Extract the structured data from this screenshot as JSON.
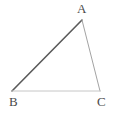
{
  "figure": {
    "type": "geometry-diagram",
    "shape": "triangle",
    "background_color": "#ffffff",
    "width": 116,
    "height": 114
  },
  "labels": {
    "a": "A",
    "b": "B",
    "c": "C"
  },
  "label_positions": {
    "a": {
      "x": 77,
      "y": 2
    },
    "b": {
      "x": 9,
      "y": 95
    },
    "c": {
      "x": 97,
      "y": 95
    }
  },
  "vertices": {
    "a": {
      "x": 82,
      "y": 20
    },
    "b": {
      "x": 12,
      "y": 91
    },
    "c": {
      "x": 100,
      "y": 91
    }
  },
  "sides": [
    {
      "name": "side-ab",
      "from": "B",
      "to": "A",
      "color": "#5a5a5a",
      "width": 1.6
    },
    {
      "name": "side-ac",
      "from": "A",
      "to": "C",
      "color": "#a3a3a3",
      "width": 1.0
    },
    {
      "name": "side-bc",
      "from": "B",
      "to": "C",
      "color": "#c6c6c6",
      "width": 1.0
    }
  ],
  "colors": {
    "label_text": "#4a4a4a",
    "stroke_dark": "#5a5a5a",
    "stroke_medium": "#a3a3a3",
    "stroke_light": "#c6c6c6",
    "background": "#ffffff"
  }
}
